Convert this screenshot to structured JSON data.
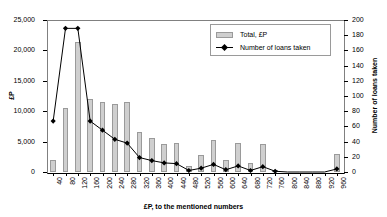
{
  "chart_data": {
    "type": "bar",
    "title": "",
    "subtitle": "",
    "xlabel": "£P, to the mentioned numbers",
    "ylabel": "£P",
    "ylabel_secondary": "Number of loans taken",
    "grid": false,
    "legend_position": "top-right",
    "categories": [
      "40",
      "80",
      "120",
      "160",
      "200",
      "240",
      "280",
      "320",
      "360",
      "400",
      "440",
      "480",
      "520",
      "560",
      "600",
      "640",
      "680",
      "720",
      "760",
      "800",
      "840",
      "880",
      "920",
      "960"
    ],
    "ylim": [
      0,
      25000
    ],
    "yticks": [
      "0",
      "5,000",
      "10,000",
      "15,000",
      "20,000",
      "25,000"
    ],
    "ytick_values": [
      0,
      5000,
      10000,
      15000,
      20000,
      25000
    ],
    "ylim_secondary": [
      0,
      200
    ],
    "yticks_secondary": [
      "0",
      "20",
      "40",
      "60",
      "80",
      "100",
      "120",
      "140",
      "160",
      "180",
      "200"
    ],
    "ytick_values_secondary": [
      0,
      20,
      40,
      60,
      80,
      100,
      120,
      140,
      160,
      180,
      200
    ],
    "series": [
      {
        "name": "Total, £P",
        "type": "bar",
        "axis": "left",
        "color": "#cfcfcf",
        "edge_color": "#9a9a9a",
        "values": [
          1900,
          10450,
          21400,
          11950,
          11450,
          11250,
          11500,
          6500,
          5600,
          4550,
          4700,
          950,
          2800,
          5300,
          1950,
          4700,
          1500,
          4600,
          300,
          0,
          0,
          0,
          0,
          3000
        ]
      },
      {
        "name": "Number of loans taken",
        "type": "line",
        "axis": "right",
        "color": "#000000",
        "marker": "diamond",
        "values": [
          67,
          189,
          189,
          67,
          55,
          43,
          38,
          19,
          15,
          12,
          11,
          2,
          5,
          10,
          3,
          8,
          2,
          7,
          1,
          0,
          0,
          0,
          0,
          4
        ]
      }
    ]
  },
  "legend": {
    "entries": [
      {
        "label": "Total, £P"
      },
      {
        "label": "Number of loans taken"
      }
    ]
  }
}
